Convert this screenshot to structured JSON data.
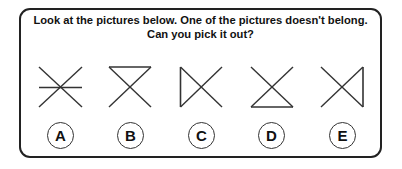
{
  "question": {
    "line1": "Look at the pictures below. One of the pictures doesn't belong.",
    "line2": "Can you pick it out?"
  },
  "figures": [
    {
      "id": "A",
      "shape": "x-with-horizontal-middle-line"
    },
    {
      "id": "B",
      "shape": "x-with-top-line"
    },
    {
      "id": "C",
      "shape": "x-with-left-line"
    },
    {
      "id": "D",
      "shape": "x-with-bottom-line"
    },
    {
      "id": "E",
      "shape": "x-with-right-line"
    }
  ],
  "options": [
    {
      "label": "A"
    },
    {
      "label": "B"
    },
    {
      "label": "C"
    },
    {
      "label": "D"
    },
    {
      "label": "E"
    }
  ],
  "colors": {
    "stroke": "#333333",
    "border": "#222222",
    "text": "#111111",
    "background": "#ffffff"
  }
}
